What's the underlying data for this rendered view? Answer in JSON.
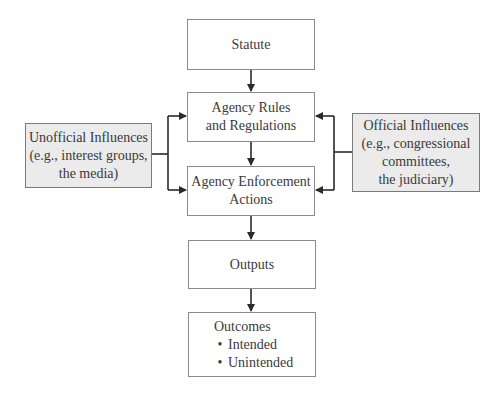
{
  "diagram": {
    "nodes": {
      "statute": {
        "lines": [
          "Statute"
        ]
      },
      "rules": {
        "lines": [
          "Agency Rules",
          "and Regulations"
        ]
      },
      "enforcement": {
        "lines": [
          "Agency Enforcement",
          "Actions"
        ]
      },
      "outputs": {
        "lines": [
          "Outputs"
        ]
      },
      "outcomes": {
        "title": "Outcomes",
        "bullets": [
          "Intended",
          "Unintended"
        ]
      },
      "unofficial": {
        "lines": [
          "Unofficial Influences",
          "(e.g., interest groups,",
          "the media)"
        ]
      },
      "official": {
        "lines": [
          "Official Influences",
          "(e.g., congressional",
          "committees,",
          "the judiciary)"
        ]
      }
    },
    "edges": [
      {
        "from": "statute",
        "to": "rules"
      },
      {
        "from": "rules",
        "to": "enforcement"
      },
      {
        "from": "enforcement",
        "to": "outputs"
      },
      {
        "from": "outputs",
        "to": "outcomes"
      },
      {
        "from": "unofficial",
        "to": "rules"
      },
      {
        "from": "unofficial",
        "to": "enforcement"
      },
      {
        "from": "official",
        "to": "rules"
      },
      {
        "from": "official",
        "to": "enforcement"
      }
    ],
    "colors": {
      "line": "#2a2a2a",
      "box_border": "#8a8a8a",
      "shaded_fill": "#ebebeb"
    }
  }
}
